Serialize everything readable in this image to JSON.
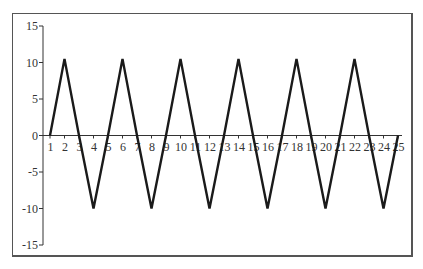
{
  "chart_data": {
    "type": "line",
    "title": "",
    "xlabel": "",
    "ylabel": "",
    "x": [
      1,
      2,
      3,
      4,
      5,
      6,
      7,
      8,
      9,
      10,
      11,
      12,
      13,
      14,
      15,
      16,
      17,
      18,
      19,
      20,
      21,
      22,
      23,
      24,
      25
    ],
    "series": [
      {
        "name": "triangle wave",
        "color": "#1a1a1a",
        "values": [
          0,
          10.5,
          0,
          -10,
          0,
          10.5,
          0,
          -10,
          0,
          10.5,
          0,
          -10,
          0,
          10.5,
          0,
          -10,
          0,
          10.5,
          0,
          -10,
          0,
          10.5,
          0,
          -10,
          0
        ]
      }
    ],
    "xticks": [
      "1",
      "2",
      "3",
      "4",
      "5",
      "6",
      "7",
      "8",
      "9",
      "10",
      "11",
      "12",
      "13",
      "14",
      "15",
      "16",
      "17",
      "18",
      "19",
      "20",
      "21",
      "22",
      "23",
      "24",
      "25"
    ],
    "yticks": [
      "15",
      "10",
      "5",
      "0",
      "-5",
      "-10",
      "-15"
    ],
    "ylim": [
      -15,
      15
    ],
    "xlim": [
      1,
      25
    ],
    "grid": false,
    "legend": false
  }
}
